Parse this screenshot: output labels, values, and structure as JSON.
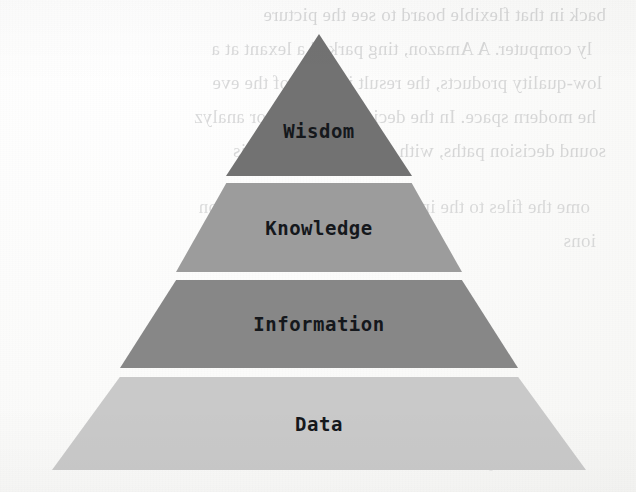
{
  "figure": {
    "type": "pyramid-diagram",
    "name": "DIKW pyramid",
    "orientation": "apex-up",
    "tier_count": 4
  },
  "tiers": [
    {
      "label": "Wisdom",
      "level": 4,
      "color": "#727272",
      "shape": "triangle"
    },
    {
      "label": "Knowledge",
      "level": 3,
      "color": "#9c9c9c",
      "shape": "trapezoid"
    },
    {
      "label": "Information",
      "level": 2,
      "color": "#878787",
      "shape": "trapezoid"
    },
    {
      "label": "Data",
      "level": 1,
      "color": "#c9c9c9",
      "shape": "trapezoid"
    }
  ],
  "page": {
    "background_color": "#fdfdfd",
    "label_color": "#15181c"
  },
  "showthrough_text": {
    "note": "faint mirrored bleed-through from the reverse side of the scanned page",
    "lines": [
      "back in that flexible board to see the picture",
      "ly computer. A Amazon, ting parked a lexant at a",
      "low-quality products, the result is some of the eve",
      "he modern space. In the decision-making, or analyz",
      "sound decision paths, with need to sort which is",
      "ome the files to the information about information",
      "ions",
      "which performance in to se"
    ]
  }
}
